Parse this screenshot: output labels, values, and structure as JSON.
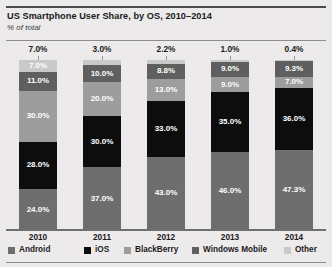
{
  "header": {
    "title": "US Smartphone User Share, by OS, 2010–2014",
    "subtitle": "% of total"
  },
  "chart_data": {
    "type": "bar",
    "title": "US Smartphone User Share, by OS, 2010–2014",
    "subtitle": "% of total",
    "xlabel": "",
    "ylabel": "% of total",
    "ylim": [
      0,
      100
    ],
    "grid": false,
    "stacked": true,
    "legend_position": "bottom",
    "categories": [
      "2010",
      "2011",
      "2012",
      "2013",
      "2014"
    ],
    "series": [
      {
        "name": "Android",
        "color": "#6e6e6e",
        "values": [
          24.0,
          37.0,
          43.0,
          46.0,
          47.3
        ],
        "labels": [
          "24.0%",
          "37.0%",
          "43.0%",
          "46.0%",
          "47.3%"
        ]
      },
      {
        "name": "iOS",
        "color": "#0d0d0d",
        "values": [
          28.0,
          30.0,
          33.0,
          35.0,
          36.0
        ],
        "labels": [
          "28.0%",
          "30.0%",
          "33.0%",
          "35.0%",
          "36.0%"
        ]
      },
      {
        "name": "BlackBerry",
        "color": "#9d9d9d",
        "values": [
          30.0,
          20.0,
          13.0,
          9.0,
          7.0
        ],
        "labels": [
          "30.0%",
          "20.0%",
          "13.0%",
          "9.0%",
          "7.0%"
        ]
      },
      {
        "name": "Windows Mobile",
        "color": "#5f5f5f",
        "values": [
          11.0,
          10.0,
          8.8,
          9.0,
          9.3
        ],
        "labels": [
          "11.0%",
          "10.0%",
          "8.8%",
          "9.0%",
          "9.3%"
        ]
      },
      {
        "name": "Other",
        "color": "#c9c9c9",
        "values": [
          7.0,
          3.0,
          2.2,
          1.0,
          0.4
        ],
        "labels": [
          "7.0%",
          "3.0%",
          "2.2%",
          "1.0%",
          "0.4%"
        ]
      }
    ],
    "top_labels": [
      "7.0%",
      "3.0%",
      "2.2%",
      "1.0%",
      "0.4%"
    ]
  },
  "axis": {
    "x_ticks": [
      "2010",
      "2011",
      "2012",
      "2013",
      "2014"
    ]
  },
  "legend": {
    "items": [
      {
        "label": "Android",
        "color": "#6e6e6e"
      },
      {
        "label": "iOS",
        "color": "#0d0d0d"
      },
      {
        "label": "BlackBerry",
        "color": "#9d9d9d"
      },
      {
        "label": "Windows Mobile",
        "color": "#5f5f5f"
      },
      {
        "label": "Other",
        "color": "#c9c9c9"
      }
    ]
  }
}
